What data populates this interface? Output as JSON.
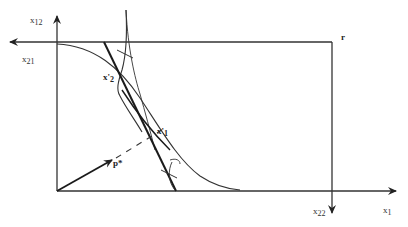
{
  "diagram": {
    "type": "edgeworth-box",
    "labels": {
      "x12": "x",
      "x12_sub": "12",
      "x21": "x",
      "x21_sub": "21",
      "x22": "x",
      "x22_sub": "22",
      "x1": "x",
      "x1_sub": "1",
      "r": "r",
      "x_prime_2": "x'",
      "x_prime_2_sub": "2",
      "x_prime_1": "x'",
      "x_prime_1_sub": "1",
      "p_star": "p*"
    },
    "colors": {
      "line": "#333333",
      "thick_line": "#1a1a1a",
      "background": "#ffffff"
    }
  }
}
